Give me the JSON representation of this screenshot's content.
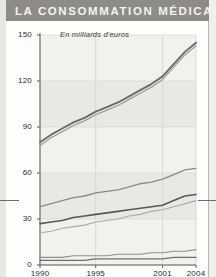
{
  "title": "LA CONSOMMATION MÉDICALE",
  "subtitle": "En milliards d'euros",
  "colors": {
    "title_band": "#8e8c88",
    "title_text": "#f4f3f1",
    "axis": "#5c5c5a",
    "grid": "#d9d7d2",
    "series_total": "#6b6b69",
    "series_total_shadow": "#9a9a97",
    "series_hospital": "#8a8a88",
    "series_ambulatory": "#57575a",
    "series_medicines": "#a9a9a6",
    "series_transport": "#8f8f8c",
    "series_other": "#6f6f6d"
  },
  "axes": {
    "y_ticks": [
      "150",
      "120",
      "90",
      "60",
      "30",
      "0"
    ],
    "y_values": [
      150,
      120,
      90,
      60,
      30,
      0
    ],
    "x_ticks": [
      "1990",
      "1995",
      "2001",
      "2004"
    ],
    "x_values": [
      1990,
      1995,
      2001,
      2004
    ]
  },
  "chart_data": {
    "type": "line",
    "title": "LA CONSOMMATION MÉDICALE",
    "subtitle": "En milliards d'euros",
    "xlabel": "",
    "ylabel": "En milliards d'euros",
    "xlim": [
      1990,
      2004
    ],
    "ylim": [
      0,
      150
    ],
    "grid": true,
    "legend": "none",
    "x": [
      1990,
      1991,
      1992,
      1993,
      1994,
      1995,
      1996,
      1997,
      1998,
      1999,
      2000,
      2001,
      2002,
      2003,
      2004
    ],
    "series": [
      {
        "name": "Consommation médicale totale",
        "color": "#6b6b69",
        "values": [
          80,
          85,
          89,
          93,
          96,
          100,
          103,
          106,
          110,
          114,
          118,
          123,
          131,
          139,
          145
        ]
      },
      {
        "name": "Consommation de soins et biens médicaux",
        "color": "#9a9a97",
        "values": [
          78,
          83,
          87,
          91,
          94,
          98,
          101,
          104,
          108,
          112,
          116,
          121,
          129,
          137,
          143
        ]
      },
      {
        "name": "Soins hospitaliers",
        "color": "#8a8a88",
        "values": [
          38,
          40,
          42,
          44,
          45,
          47,
          48,
          49,
          51,
          53,
          54,
          56,
          59,
          62,
          63
        ]
      },
      {
        "name": "Soins ambulatoires",
        "color": "#57575a",
        "values": [
          27,
          28,
          29,
          31,
          32,
          33,
          34,
          35,
          36,
          37,
          38,
          39,
          42,
          45,
          46
        ]
      },
      {
        "name": "Médicaments",
        "color": "#a9a9a6",
        "values": [
          21,
          22,
          24,
          25,
          26,
          28,
          29,
          30,
          32,
          33,
          35,
          36,
          38,
          40,
          42
        ]
      },
      {
        "name": "Autres biens médicaux",
        "color": "#8f8f8c",
        "values": [
          5,
          5,
          5,
          6,
          6,
          6,
          6,
          7,
          7,
          7,
          8,
          8,
          9,
          9,
          10
        ]
      },
      {
        "name": "Transports de malades",
        "color": "#6f6f6d",
        "values": [
          3,
          3,
          3,
          3,
          3,
          4,
          4,
          4,
          4,
          4,
          4,
          4,
          5,
          5,
          5
        ]
      }
    ]
  }
}
